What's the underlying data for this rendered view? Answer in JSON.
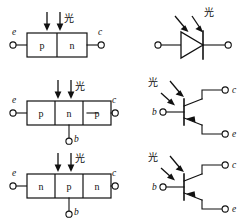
{
  "figure": {
    "title": "",
    "rows": [
      {
        "id": "row-photodiode",
        "structure": {
          "terminals": {
            "left": "e",
            "right": "c"
          },
          "layers": [
            "p",
            "n"
          ],
          "base_terminal": null,
          "light_label": "光",
          "light_arrow_count": 2,
          "light_direction": "down"
        },
        "symbol": {
          "type": "photodiode",
          "terminals": [
            "",
            ""
          ],
          "light_label": "光",
          "light_arrow_count": 2,
          "light_direction": "down-left-to-device"
        }
      },
      {
        "id": "row-pnp-phototransistor",
        "structure": {
          "terminals": {
            "left": "e",
            "right": "c"
          },
          "layers": [
            "p",
            "n",
            "p"
          ],
          "base_terminal": "b",
          "light_label": "光",
          "light_arrow_count": 2,
          "light_direction": "down"
        },
        "symbol": {
          "type": "phototransistor-pnp",
          "terminals": {
            "base": "b",
            "collector": "c",
            "emitter": "e"
          },
          "light_label": "光",
          "light_arrow_count": 2,
          "light_direction": "down-left-to-device"
        }
      },
      {
        "id": "row-npn-phototransistor",
        "structure": {
          "terminals": {
            "left": "e",
            "right": "c"
          },
          "layers": [
            "n",
            "p",
            "n"
          ],
          "base_terminal": "b",
          "light_label": "光",
          "light_arrow_count": 2,
          "light_direction": "down"
        },
        "symbol": {
          "type": "phototransistor-npn",
          "terminals": {
            "base": "b",
            "collector": "c",
            "emitter": "e"
          },
          "light_label": "光",
          "light_arrow_count": 2,
          "light_direction": "down-left-to-device"
        }
      }
    ],
    "colors": {
      "ink": "#111111",
      "background": "#ffffff"
    }
  }
}
